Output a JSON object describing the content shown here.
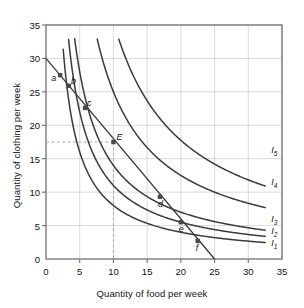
{
  "chart_data": {
    "type": "line",
    "title": "",
    "xlabel": "Quantity of food per week",
    "ylabel": "Quantity of clothing per week",
    "xlim": [
      0,
      35
    ],
    "ylim": [
      0,
      35
    ],
    "xticks": [
      0,
      5,
      10,
      15,
      20,
      25,
      30,
      35
    ],
    "yticks": [
      0,
      5,
      10,
      15,
      20,
      25,
      30,
      35
    ],
    "grid": true,
    "legend_position": "right-inline",
    "axis_color": "#6f6f78",
    "curve_color": "#3a3a3a",
    "grid_color": "#c9c9d2",
    "dash_color": "#a9a9b4",
    "background": "#ffffff",
    "series": [
      {
        "name": "I1",
        "label": "I",
        "subscript": "1",
        "label_x": 33.4,
        "label_y": 2.2,
        "k": 80,
        "x_start": 2.55,
        "x_end": 32.5
      },
      {
        "name": "I2",
        "label": "I",
        "subscript": "2",
        "label_x": 33.4,
        "label_y": 4.0,
        "k": 110,
        "x_start": 3.35,
        "x_end": 32.5
      },
      {
        "name": "I3",
        "label": "I",
        "subscript": "3",
        "label_x": 33.4,
        "label_y": 5.9,
        "k": 140,
        "x_start": 4.25,
        "x_end": 32.5
      },
      {
        "name": "I4",
        "label": "I",
        "subscript": "4",
        "label_x": 33.4,
        "label_y": 11.3,
        "k": 250,
        "x_start": 7.6,
        "x_end": 32.5
      },
      {
        "name": "I5",
        "label": "I",
        "subscript": "5",
        "label_x": 33.4,
        "label_y": 16.2,
        "k": 355,
        "x_start": 10.8,
        "x_end": 32.5
      }
    ],
    "budget_line": {
      "name": "budget-line",
      "x_intercept": 25,
      "y_intercept": 30
    },
    "points": [
      {
        "label": "a",
        "x": 2.1,
        "y": 27.5,
        "label_dx": -9,
        "label_dy": 4
      },
      {
        "label": "b",
        "x": 3.4,
        "y": 25.9,
        "label_dx": 2,
        "label_dy": -4
      },
      {
        "label": "c",
        "x": 5.8,
        "y": 22.6,
        "label_dx": 2,
        "label_dy": -4
      },
      {
        "label": "E",
        "x": 10.0,
        "y": 17.5,
        "label_dx": 3,
        "label_dy": -4
      },
      {
        "label": "d",
        "x": 16.9,
        "y": 9.3,
        "label_dx": -2,
        "label_dy": 8
      },
      {
        "label": "e",
        "x": 20.0,
        "y": 5.5,
        "label_dx": -2,
        "label_dy": 8
      },
      {
        "label": "f",
        "x": 22.5,
        "y": 2.7,
        "label_dx": -2,
        "label_dy": 8
      }
    ],
    "guides": [
      {
        "name": "guide-horizontal-E",
        "from": [
          0,
          17.5
        ],
        "to": [
          10,
          17.5
        ],
        "style": "dashed"
      },
      {
        "name": "guide-vertical-E",
        "from": [
          10,
          17.5
        ],
        "to": [
          10,
          0
        ],
        "style": "dashed"
      }
    ]
  }
}
